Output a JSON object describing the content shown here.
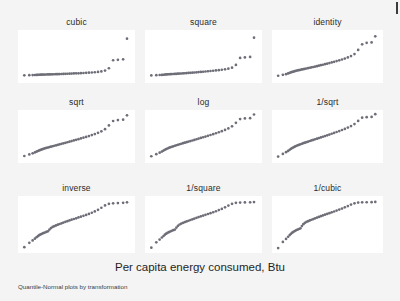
{
  "figure": {
    "xtitle": "Per capita energy consumed, Btu",
    "note": "Quantile-Normal plots by transformation",
    "background_color": "#f4f4f4",
    "panel_color": "#ffffff",
    "marker_color": "#6e6e78"
  },
  "chart_data": {
    "type": "scatter",
    "title": "",
    "xlabel": "Per capita energy consumed, Btu",
    "ylabel": "",
    "note": "Quantile-Normal plots by transformation",
    "grid": false,
    "legend": "none",
    "layout": {
      "rows": 3,
      "cols": 3
    },
    "panels": [
      {
        "label": "cubic",
        "row": 0,
        "col": 0,
        "xlabel": "",
        "ylabel": "",
        "xlim": [
          0,
          1
        ],
        "ylim": [
          0,
          1
        ],
        "x": [
          0.03,
          0.075,
          0.105,
          0.125,
          0.14,
          0.152,
          0.164,
          0.176,
          0.188,
          0.2,
          0.214,
          0.228,
          0.242,
          0.256,
          0.27,
          0.285,
          0.3,
          0.316,
          0.332,
          0.348,
          0.365,
          0.382,
          0.4,
          0.418,
          0.437,
          0.456,
          0.476,
          0.497,
          0.518,
          0.54,
          0.563,
          0.587,
          0.612,
          0.638,
          0.665,
          0.694,
          0.724,
          0.757,
          0.792,
          0.83,
          0.873,
          0.92,
          0.955
        ],
        "y": [
          0.1,
          0.102,
          0.104,
          0.106,
          0.108,
          0.11,
          0.112,
          0.113,
          0.114,
          0.115,
          0.116,
          0.117,
          0.118,
          0.119,
          0.12,
          0.121,
          0.122,
          0.124,
          0.125,
          0.126,
          0.128,
          0.129,
          0.131,
          0.133,
          0.135,
          0.137,
          0.139,
          0.141,
          0.143,
          0.146,
          0.149,
          0.152,
          0.156,
          0.16,
          0.165,
          0.172,
          0.182,
          0.2,
          0.25,
          0.42,
          0.43,
          0.44,
          0.88
        ]
      },
      {
        "label": "square",
        "row": 0,
        "col": 1,
        "xlabel": "",
        "ylabel": "",
        "xlim": [
          0,
          1
        ],
        "ylim": [
          0,
          1
        ],
        "x": [
          0.03,
          0.075,
          0.105,
          0.125,
          0.14,
          0.152,
          0.164,
          0.176,
          0.188,
          0.2,
          0.214,
          0.228,
          0.242,
          0.256,
          0.27,
          0.285,
          0.3,
          0.316,
          0.332,
          0.348,
          0.365,
          0.382,
          0.4,
          0.418,
          0.437,
          0.456,
          0.476,
          0.497,
          0.518,
          0.54,
          0.563,
          0.587,
          0.612,
          0.638,
          0.665,
          0.694,
          0.724,
          0.757,
          0.792,
          0.83,
          0.873,
          0.92,
          0.955
        ],
        "y": [
          0.098,
          0.102,
          0.106,
          0.109,
          0.112,
          0.115,
          0.118,
          0.12,
          0.122,
          0.124,
          0.126,
          0.128,
          0.13,
          0.132,
          0.134,
          0.136,
          0.138,
          0.141,
          0.144,
          0.147,
          0.15,
          0.153,
          0.156,
          0.16,
          0.164,
          0.168,
          0.172,
          0.176,
          0.181,
          0.186,
          0.191,
          0.197,
          0.203,
          0.21,
          0.218,
          0.228,
          0.24,
          0.262,
          0.32,
          0.47,
          0.48,
          0.49,
          0.9
        ]
      },
      {
        "label": "identity",
        "row": 0,
        "col": 2,
        "xlabel": "",
        "ylabel": "",
        "xlim": [
          0,
          1
        ],
        "ylim": [
          0,
          1
        ],
        "x": [
          0.03,
          0.075,
          0.105,
          0.125,
          0.14,
          0.152,
          0.164,
          0.176,
          0.188,
          0.2,
          0.214,
          0.228,
          0.242,
          0.256,
          0.27,
          0.285,
          0.3,
          0.316,
          0.332,
          0.348,
          0.365,
          0.382,
          0.4,
          0.418,
          0.437,
          0.456,
          0.476,
          0.497,
          0.518,
          0.54,
          0.563,
          0.587,
          0.612,
          0.638,
          0.665,
          0.694,
          0.724,
          0.757,
          0.792,
          0.83,
          0.873,
          0.92,
          0.955
        ],
        "y": [
          0.09,
          0.11,
          0.125,
          0.14,
          0.152,
          0.163,
          0.172,
          0.18,
          0.188,
          0.196,
          0.203,
          0.21,
          0.217,
          0.224,
          0.231,
          0.238,
          0.245,
          0.253,
          0.261,
          0.269,
          0.277,
          0.286,
          0.295,
          0.305,
          0.315,
          0.325,
          0.336,
          0.348,
          0.36,
          0.373,
          0.387,
          0.402,
          0.418,
          0.436,
          0.456,
          0.48,
          0.51,
          0.552,
          0.64,
          0.76,
          0.79,
          0.8,
          0.93
        ]
      },
      {
        "label": "sqrt",
        "row": 1,
        "col": 0,
        "xlabel": "",
        "ylabel": "",
        "xlim": [
          0,
          1
        ],
        "ylim": [
          0,
          1
        ],
        "x": [
          0.03,
          0.075,
          0.105,
          0.125,
          0.14,
          0.152,
          0.164,
          0.176,
          0.188,
          0.2,
          0.214,
          0.228,
          0.242,
          0.256,
          0.27,
          0.285,
          0.3,
          0.316,
          0.332,
          0.348,
          0.365,
          0.382,
          0.4,
          0.418,
          0.437,
          0.456,
          0.476,
          0.497,
          0.518,
          0.54,
          0.563,
          0.587,
          0.612,
          0.638,
          0.665,
          0.694,
          0.724,
          0.757,
          0.792,
          0.83,
          0.873,
          0.92,
          0.955
        ],
        "y": [
          0.085,
          0.118,
          0.142,
          0.162,
          0.178,
          0.192,
          0.204,
          0.215,
          0.226,
          0.236,
          0.246,
          0.256,
          0.265,
          0.275,
          0.284,
          0.293,
          0.303,
          0.313,
          0.323,
          0.333,
          0.344,
          0.355,
          0.366,
          0.378,
          0.39,
          0.403,
          0.416,
          0.43,
          0.444,
          0.459,
          0.475,
          0.492,
          0.51,
          0.53,
          0.552,
          0.578,
          0.61,
          0.655,
          0.735,
          0.83,
          0.85,
          0.858,
          0.95
        ]
      },
      {
        "label": "log",
        "row": 1,
        "col": 1,
        "xlabel": "",
        "ylabel": "",
        "xlim": [
          0,
          1
        ],
        "ylim": [
          0,
          1
        ],
        "x": [
          0.03,
          0.075,
          0.105,
          0.125,
          0.14,
          0.152,
          0.164,
          0.176,
          0.188,
          0.2,
          0.214,
          0.228,
          0.242,
          0.256,
          0.27,
          0.285,
          0.3,
          0.316,
          0.332,
          0.348,
          0.365,
          0.382,
          0.4,
          0.418,
          0.437,
          0.456,
          0.476,
          0.497,
          0.518,
          0.54,
          0.563,
          0.587,
          0.612,
          0.638,
          0.665,
          0.694,
          0.724,
          0.757,
          0.792,
          0.83,
          0.873,
          0.92,
          0.955
        ],
        "y": [
          0.08,
          0.125,
          0.155,
          0.18,
          0.2,
          0.218,
          0.232,
          0.245,
          0.258,
          0.27,
          0.281,
          0.292,
          0.303,
          0.314,
          0.324,
          0.335,
          0.346,
          0.357,
          0.368,
          0.379,
          0.391,
          0.403,
          0.415,
          0.428,
          0.441,
          0.455,
          0.469,
          0.484,
          0.499,
          0.515,
          0.532,
          0.55,
          0.569,
          0.59,
          0.613,
          0.64,
          0.672,
          0.716,
          0.79,
          0.87,
          0.885,
          0.89,
          0.968
        ]
      },
      {
        "label": "1/sqrt",
        "row": 1,
        "col": 2,
        "xlabel": "",
        "ylabel": "",
        "xlim": [
          0,
          1
        ],
        "ylim": [
          0,
          1
        ],
        "x": [
          0.03,
          0.075,
          0.105,
          0.125,
          0.14,
          0.152,
          0.164,
          0.176,
          0.188,
          0.2,
          0.214,
          0.228,
          0.242,
          0.256,
          0.27,
          0.285,
          0.3,
          0.316,
          0.332,
          0.348,
          0.365,
          0.382,
          0.4,
          0.418,
          0.437,
          0.456,
          0.476,
          0.497,
          0.518,
          0.54,
          0.563,
          0.587,
          0.612,
          0.638,
          0.665,
          0.694,
          0.724,
          0.757,
          0.792,
          0.83,
          0.873,
          0.92,
          0.955
        ],
        "y": [
          0.072,
          0.13,
          0.166,
          0.194,
          0.218,
          0.238,
          0.255,
          0.27,
          0.284,
          0.298,
          0.31,
          0.322,
          0.334,
          0.346,
          0.357,
          0.369,
          0.38,
          0.392,
          0.404,
          0.416,
          0.428,
          0.441,
          0.454,
          0.467,
          0.481,
          0.495,
          0.51,
          0.526,
          0.542,
          0.559,
          0.577,
          0.596,
          0.616,
          0.638,
          0.662,
          0.69,
          0.722,
          0.765,
          0.832,
          0.9,
          0.912,
          0.916,
          0.975
        ]
      },
      {
        "label": "inverse",
        "row": 2,
        "col": 0,
        "xlabel": "",
        "ylabel": "",
        "xlim": [
          0,
          1
        ],
        "ylim": [
          0,
          1
        ],
        "x": [
          0.03,
          0.075,
          0.105,
          0.125,
          0.14,
          0.152,
          0.164,
          0.176,
          0.188,
          0.2,
          0.214,
          0.228,
          0.242,
          0.256,
          0.27,
          0.285,
          0.3,
          0.316,
          0.332,
          0.348,
          0.365,
          0.382,
          0.4,
          0.418,
          0.437,
          0.456,
          0.476,
          0.497,
          0.518,
          0.54,
          0.563,
          0.587,
          0.612,
          0.638,
          0.665,
          0.694,
          0.724,
          0.757,
          0.792,
          0.83,
          0.873,
          0.92,
          0.955
        ],
        "y": [
          0.055,
          0.14,
          0.188,
          0.222,
          0.25,
          0.272,
          0.29,
          0.305,
          0.318,
          0.33,
          0.342,
          0.354,
          0.366,
          0.4,
          0.43,
          0.452,
          0.468,
          0.482,
          0.496,
          0.51,
          0.524,
          0.538,
          0.552,
          0.566,
          0.58,
          0.594,
          0.608,
          0.622,
          0.638,
          0.654,
          0.67,
          0.688,
          0.708,
          0.73,
          0.756,
          0.788,
          0.828,
          0.875,
          0.905,
          0.915,
          0.92,
          0.925,
          0.935
        ]
      },
      {
        "label": "1/square",
        "row": 2,
        "col": 1,
        "xlabel": "",
        "ylabel": "",
        "xlim": [
          0,
          1
        ],
        "ylim": [
          0,
          1
        ],
        "x": [
          0.03,
          0.075,
          0.105,
          0.125,
          0.14,
          0.152,
          0.164,
          0.176,
          0.188,
          0.2,
          0.214,
          0.228,
          0.242,
          0.256,
          0.27,
          0.285,
          0.3,
          0.316,
          0.332,
          0.348,
          0.365,
          0.382,
          0.4,
          0.418,
          0.437,
          0.456,
          0.476,
          0.497,
          0.518,
          0.54,
          0.563,
          0.587,
          0.612,
          0.638,
          0.665,
          0.694,
          0.724,
          0.757,
          0.792,
          0.83,
          0.873,
          0.92,
          0.955
        ],
        "y": [
          0.045,
          0.15,
          0.205,
          0.245,
          0.275,
          0.3,
          0.32,
          0.336,
          0.35,
          0.363,
          0.376,
          0.388,
          0.4,
          0.44,
          0.475,
          0.5,
          0.518,
          0.533,
          0.547,
          0.56,
          0.574,
          0.588,
          0.602,
          0.616,
          0.63,
          0.645,
          0.66,
          0.675,
          0.69,
          0.706,
          0.722,
          0.74,
          0.76,
          0.782,
          0.806,
          0.836,
          0.872,
          0.906,
          0.925,
          0.93,
          0.932,
          0.934,
          0.94
        ]
      },
      {
        "label": "1/cubic",
        "row": 2,
        "col": 2,
        "xlabel": "",
        "ylabel": "",
        "xlim": [
          0,
          1
        ],
        "ylim": [
          0,
          1
        ],
        "x": [
          0.03,
          0.075,
          0.105,
          0.125,
          0.14,
          0.152,
          0.164,
          0.176,
          0.188,
          0.2,
          0.214,
          0.228,
          0.242,
          0.256,
          0.27,
          0.285,
          0.3,
          0.316,
          0.332,
          0.348,
          0.365,
          0.382,
          0.4,
          0.418,
          0.437,
          0.456,
          0.476,
          0.497,
          0.518,
          0.54,
          0.563,
          0.587,
          0.612,
          0.638,
          0.665,
          0.694,
          0.724,
          0.757,
          0.792,
          0.83,
          0.873,
          0.92,
          0.955
        ],
        "y": [
          0.038,
          0.158,
          0.218,
          0.26,
          0.292,
          0.318,
          0.34,
          0.357,
          0.372,
          0.386,
          0.399,
          0.412,
          0.425,
          0.47,
          0.506,
          0.532,
          0.55,
          0.565,
          0.579,
          0.593,
          0.607,
          0.621,
          0.635,
          0.649,
          0.663,
          0.678,
          0.693,
          0.708,
          0.723,
          0.739,
          0.755,
          0.773,
          0.792,
          0.813,
          0.836,
          0.862,
          0.89,
          0.915,
          0.93,
          0.934,
          0.936,
          0.938,
          0.942
        ]
      }
    ]
  }
}
